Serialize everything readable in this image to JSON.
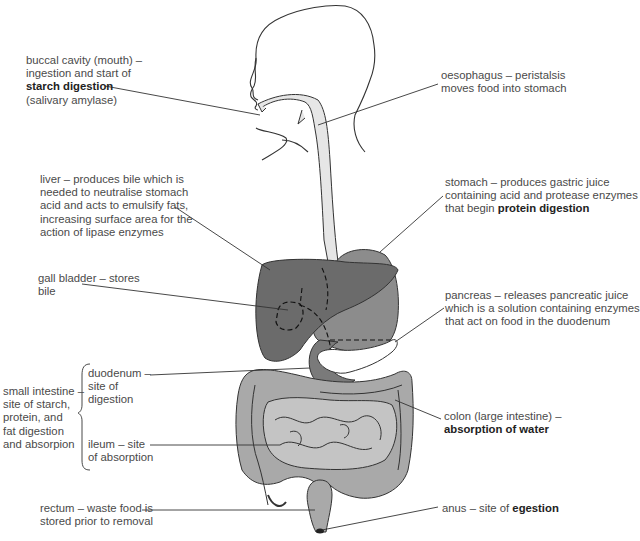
{
  "diagram": {
    "colors": {
      "liver": "#6b6b6b",
      "stomach": "#8c8c8c",
      "duodenum": "#7a7a7a",
      "oesophagus": "#e6e6e6",
      "small_intestine": "#c4c4c4",
      "colon": "#a9a9a9",
      "pancreas": "#ffffff",
      "outline": "#2a2a2a",
      "text": "#4a4a4a"
    },
    "labels": {
      "mouth": {
        "lines": [
          "buccal cavity (mouth) –",
          "ingestion and start of"
        ],
        "bold": "starch digestion",
        "after": "(salivary amylase)"
      },
      "oesophagus": {
        "lines": [
          "oesophagus – peristalsis",
          "moves food into stomach"
        ]
      },
      "liver": {
        "lines": [
          "liver – produces bile which is",
          "needed to neutralise stomach",
          "acid and acts to emulsify fats,",
          "increasing surface area for the",
          "action of lipase enzymes"
        ]
      },
      "stomach": {
        "lines": [
          "stomach – produces gastric juice",
          "containing acid and protease enzymes"
        ],
        "prefix": "that begin ",
        "bold": "protein digestion"
      },
      "gall_bladder": {
        "lines": [
          "gall bladder – stores",
          "bile"
        ]
      },
      "pancreas": {
        "lines": [
          "pancreas – releases pancreatic juice",
          "which is a solution containing enzymes",
          "that act on food in the duodenum"
        ]
      },
      "small_intestine": {
        "lines": [
          "small intestine –",
          "site of starch,",
          "protein, and",
          "fat digestion",
          "and absorpion"
        ]
      },
      "duodenum": {
        "lines": [
          "duodenum –",
          "site of",
          "digestion"
        ]
      },
      "ileum": {
        "lines": [
          "ileum – site",
          "of absorption"
        ]
      },
      "colon": {
        "lines": [
          "colon (large intestine) –"
        ],
        "bold": "absorption of water"
      },
      "rectum": {
        "lines": [
          "rectum – waste food is",
          "stored prior to removal"
        ]
      },
      "anus": {
        "prefix": "anus – site of ",
        "bold": "egestion"
      }
    }
  }
}
